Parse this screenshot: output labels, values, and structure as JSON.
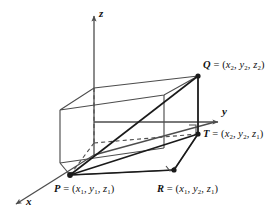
{
  "figure": {
    "background": "#ffffff",
    "line_color": "#4d4d4d",
    "heavy_line_color": "#1a1a1a",
    "text_color": "#111111",
    "width": 277,
    "height": 216
  },
  "axes": {
    "x": {
      "label": "x",
      "arrow": "down-left"
    },
    "y": {
      "label": "y",
      "arrow": "right"
    },
    "z": {
      "label": "z",
      "arrow": "up"
    }
  },
  "points": {
    "Q": {
      "name": "Q",
      "eq": "=",
      "open": "(",
      "close": ")",
      "comma": ",",
      "coords": [
        {
          "var": "x",
          "sub": "2"
        },
        {
          "var": "y",
          "sub": "2"
        },
        {
          "var": "z",
          "sub": "2"
        }
      ],
      "full_label": "Q = (x2, y2, z2)"
    },
    "T": {
      "name": "T",
      "eq": "=",
      "open": "(",
      "close": ")",
      "comma": ",",
      "coords": [
        {
          "var": "x",
          "sub": "2"
        },
        {
          "var": "y",
          "sub": "2"
        },
        {
          "var": "z",
          "sub": "1"
        }
      ],
      "full_label": "T = (x2, y2, z1)"
    },
    "P": {
      "name": "P",
      "eq": "=",
      "open": "(",
      "close": ")",
      "comma": ",",
      "coords": [
        {
          "var": "x",
          "sub": "1"
        },
        {
          "var": "y",
          "sub": "1"
        },
        {
          "var": "z",
          "sub": "1"
        }
      ],
      "full_label": "P = (x1, y1, z1)"
    },
    "R": {
      "name": "R",
      "eq": "=",
      "open": "(",
      "close": ")",
      "comma": ",",
      "coords": [
        {
          "var": "x",
          "sub": "1"
        },
        {
          "var": "y",
          "sub": "2"
        },
        {
          "var": "z",
          "sub": "1"
        }
      ],
      "full_label": "R = (x1, y2, z1)"
    }
  }
}
